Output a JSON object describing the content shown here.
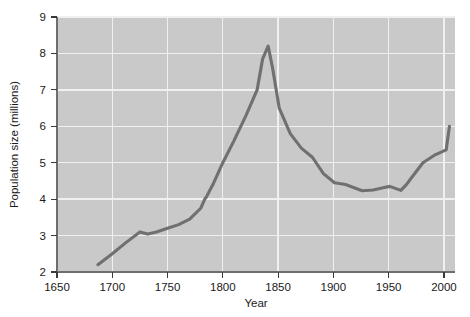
{
  "chart_data": {
    "type": "line",
    "title": "",
    "xlabel": "Year",
    "ylabel": "Population size (millions)",
    "xlim": [
      1650,
      2010
    ],
    "ylim": [
      2,
      9
    ],
    "xticks": [
      1650,
      1700,
      1750,
      1800,
      1850,
      1900,
      1950,
      2000
    ],
    "yticks": [
      2,
      3,
      4,
      5,
      6,
      7,
      8,
      9
    ],
    "xtick_labels": [
      "1650",
      "1700",
      "1750",
      "1800",
      "1850",
      "1900",
      "1950",
      "2000"
    ],
    "ytick_labels": [
      "2",
      "3",
      "4",
      "5",
      "6",
      "7",
      "8",
      "9"
    ],
    "grid": true,
    "legend": "none",
    "series": [
      {
        "name": "Population size",
        "x": [
          1687,
          1700,
          1712,
          1725,
          1732,
          1740,
          1750,
          1760,
          1770,
          1780,
          1784,
          1785,
          1791,
          1800,
          1810,
          1821,
          1831,
          1836,
          1841,
          1845,
          1851,
          1861,
          1871,
          1881,
          1891,
          1901,
          1911,
          1926,
          1936,
          1946,
          1951,
          1961,
          1966,
          1971,
          1981,
          1991,
          2002,
          2005
        ],
        "y": [
          2.2,
          2.5,
          2.8,
          3.1,
          3.04,
          3.1,
          3.2,
          3.3,
          3.45,
          3.75,
          4.02,
          4.05,
          4.4,
          5.0,
          5.6,
          6.3,
          7.0,
          7.85,
          8.2,
          7.6,
          6.5,
          5.8,
          5.4,
          5.15,
          4.7,
          4.45,
          4.4,
          4.23,
          4.25,
          4.32,
          4.35,
          4.24,
          4.4,
          4.6,
          5.0,
          5.2,
          5.35,
          6.0
        ]
      }
    ],
    "plot_area": {
      "left": 57,
      "top": 17,
      "right": 455,
      "bottom": 272
    },
    "colors": {
      "plot_background": "#c9c9c9",
      "gridline": "#f0f0f0",
      "line": "#707070",
      "axis": "#6e6e6e",
      "text": "#1a1a1a",
      "figure_background": "#ffffff"
    }
  }
}
